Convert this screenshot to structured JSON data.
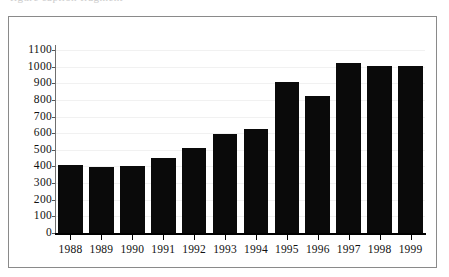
{
  "page": {
    "top_text_fragment": "figure caption fragment"
  },
  "chart_data": {
    "type": "bar",
    "title": "",
    "xlabel": "",
    "ylabel": "",
    "ylim": [
      0,
      1100
    ],
    "ytick_step": 100,
    "grid": true,
    "legend": "none",
    "bar_color": "#0a0a0a",
    "categories": [
      "1988",
      "1989",
      "1990",
      "1991",
      "1992",
      "1993",
      "1994",
      "1995",
      "1996",
      "1997",
      "1998",
      "1999"
    ],
    "values": [
      410,
      395,
      405,
      450,
      510,
      595,
      625,
      910,
      825,
      1020,
      1005,
      1005
    ],
    "ytick_labels": [
      "1100",
      "1000",
      "900",
      "800",
      "700",
      "600",
      "500",
      "400",
      "300",
      "200",
      "100",
      "0"
    ]
  }
}
